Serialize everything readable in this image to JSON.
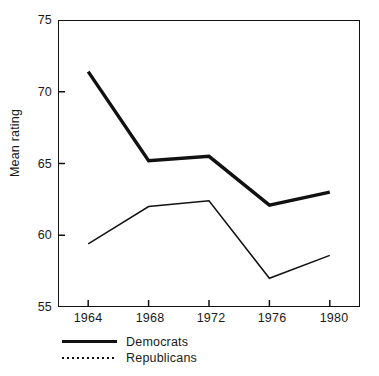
{
  "chart_data": {
    "type": "line",
    "title": "",
    "subtitle": "",
    "xlabel": "",
    "ylabel": "Mean rating",
    "categories": [
      "1964",
      "1968",
      "1972",
      "1976",
      "1980"
    ],
    "x": [
      1964,
      1968,
      1972,
      1976,
      1980
    ],
    "xlim": [
      1962,
      1982
    ],
    "ylim": [
      55,
      75
    ],
    "yticks": [
      55,
      60,
      65,
      70,
      75
    ],
    "ytick_labels": [
      "55",
      "60",
      "65",
      "70",
      "75"
    ],
    "xticks": [
      1964,
      1968,
      1972,
      1976,
      1980
    ],
    "xtick_labels": [
      "1964",
      "1968",
      "1972",
      "1976",
      "1980"
    ],
    "grid": false,
    "legend_position": "below-axes-left",
    "series": [
      {
        "name": "Democrats",
        "style": "solid-thick",
        "color": "#111111",
        "values": [
          71.4,
          65.2,
          65.5,
          62.1,
          63.0
        ]
      },
      {
        "name": "Republicans",
        "style": "thin",
        "color": "#111111",
        "values": [
          59.4,
          62.0,
          62.4,
          57.0,
          58.6
        ]
      }
    ]
  },
  "axes": {
    "y_axis_title": "Mean rating",
    "y_tick_0": "55",
    "y_tick_1": "60",
    "y_tick_2": "65",
    "y_tick_3": "70",
    "y_tick_4": "75",
    "x_tick_0": "1964",
    "x_tick_1": "1968",
    "x_tick_2": "1972",
    "x_tick_3": "1976",
    "x_tick_4": "1980"
  },
  "legend": {
    "items": [
      {
        "label": "Democrats",
        "marker": "solid-line-swatch"
      },
      {
        "label": "Republicans",
        "marker": "dotted-line-swatch"
      }
    ]
  }
}
